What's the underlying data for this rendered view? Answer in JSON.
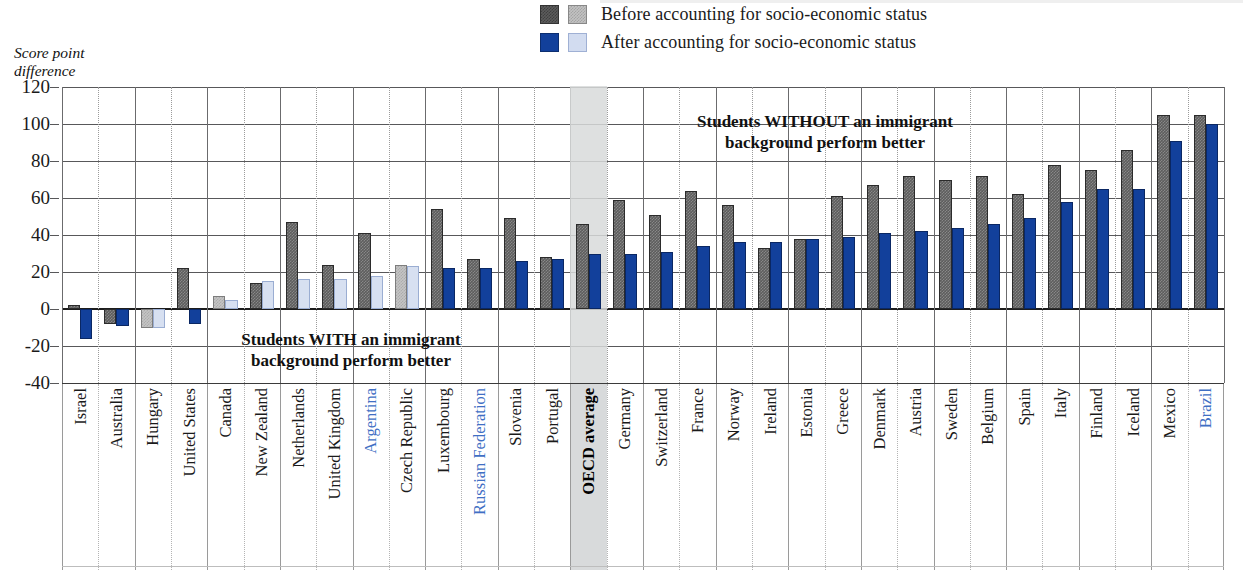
{
  "axis_title": "Score point\ndifference",
  "legend": {
    "items": [
      {
        "label": "Before accounting for socio-economic status",
        "dark_swatch": "#5c5c5c",
        "light_swatch": "#c2c2c2"
      },
      {
        "label": "After accounting for socio-economic status",
        "dark_swatch": "#12409b",
        "light_swatch": "#d2dcf0"
      }
    ]
  },
  "annotations": {
    "with": "Students WITH an immigrant\nbackground perform better",
    "without": "Students WITHOUT an immigrant\nbackground perform better"
  },
  "colors": {
    "before": "#5d5d5d",
    "before_light": "#c4c4c4",
    "after": "#12409b",
    "after_light": "#d7e0f1",
    "partner_label": "#3f6fc4",
    "highlight_band": "#d8dadb"
  },
  "chart_data": {
    "type": "bar",
    "title": "",
    "xlabel": "",
    "ylabel": "Score point difference",
    "ylim": [
      -40,
      120
    ],
    "yticks": [
      120,
      100,
      80,
      60,
      40,
      20,
      0,
      -20,
      -40
    ],
    "grid": true,
    "legend_position": "top-center",
    "categories": [
      "Israel",
      "Australia",
      "Hungary",
      "United States",
      "Canada",
      "New Zealand",
      "Netherlands",
      "United Kingdom",
      "Argentina",
      "Czech Republic",
      "Luxembourg",
      "Russian Federation",
      "Slovenia",
      "Portugal",
      "OECD average",
      "Germany",
      "Switzerland",
      "France",
      "Norway",
      "Ireland",
      "Estonia",
      "Greece",
      "Denmark",
      "Austria",
      "Sweden",
      "Belgium",
      "Spain",
      "Italy",
      "Finland",
      "Iceland",
      "Mexico",
      "Brazil"
    ],
    "partner_countries": [
      "Argentina",
      "Russian Federation",
      "Brazil"
    ],
    "highlighted_category": "OECD average",
    "series": [
      {
        "name": "Before accounting for socio-economic status",
        "values": [
          2,
          -8,
          -10,
          22,
          7,
          14,
          47,
          24,
          41,
          24,
          54,
          27,
          49,
          28,
          46,
          59,
          51,
          64,
          56,
          33,
          38,
          61,
          67,
          72,
          70,
          72,
          62,
          78,
          75,
          86,
          105,
          105
        ],
        "faded": [
          false,
          false,
          true,
          false,
          true,
          false,
          false,
          false,
          false,
          true,
          false,
          false,
          false,
          false,
          false,
          false,
          false,
          false,
          false,
          false,
          false,
          false,
          false,
          false,
          false,
          false,
          false,
          false,
          false,
          false,
          false,
          false
        ]
      },
      {
        "name": "After accounting for socio-economic status",
        "values": [
          -16,
          -9,
          -10,
          -8,
          5,
          15,
          16,
          16,
          18,
          23,
          22,
          22,
          26,
          27,
          30,
          30,
          31,
          34,
          36,
          36,
          38,
          39,
          41,
          42,
          44,
          46,
          49,
          58,
          65,
          65,
          91,
          100
        ],
        "faded": [
          false,
          false,
          true,
          false,
          true,
          true,
          true,
          true,
          true,
          true,
          false,
          false,
          false,
          false,
          false,
          false,
          false,
          false,
          false,
          false,
          false,
          false,
          false,
          false,
          false,
          false,
          false,
          false,
          false,
          false,
          false,
          false
        ]
      }
    ]
  }
}
